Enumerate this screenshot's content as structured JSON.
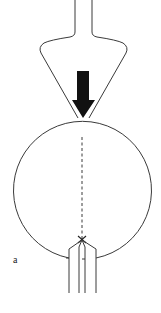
{
  "figure": {
    "panel_label": "a",
    "colors": {
      "stroke": "#3a3a3a",
      "arrow_fill": "#111111",
      "background": "#ffffff"
    },
    "elements": {
      "indenter": "conical indenter with narrow stem",
      "force_arrow": "downward load arrow",
      "sphere": "circular specimen",
      "crack_path": "dashed vertical line",
      "grips": "two U-shaped jaws/holder at bottom"
    }
  }
}
